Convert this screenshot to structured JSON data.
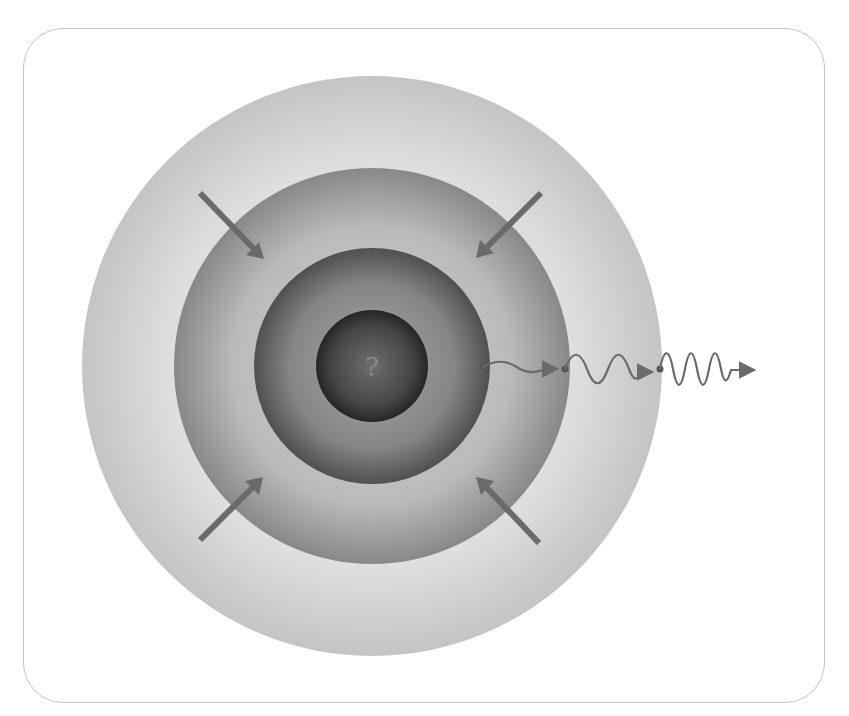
{
  "diagram": {
    "core_label": "?",
    "layers": [
      {
        "name": "outer-shell",
        "radius": 290,
        "color_edge": "#c9c9c9",
        "color_inner": "#e4e4e4"
      },
      {
        "name": "second-shell",
        "radius": 198,
        "color_edge": "#8a8a8a",
        "color_inner": "#cfcfcf"
      },
      {
        "name": "third-shell",
        "radius": 118,
        "color_edge": "#555555",
        "color_inner": "#9a9a9a"
      },
      {
        "name": "core",
        "radius": 56,
        "color_edge": "#2a2a2a",
        "color_inner": "#6a6a6a"
      }
    ],
    "inward_arrows": [
      {
        "position": "top-left"
      },
      {
        "position": "top-right"
      },
      {
        "position": "bottom-left"
      },
      {
        "position": "bottom-right"
      }
    ],
    "wave_segments": [
      {
        "name": "wave-low-frequency",
        "color": "#6b6b6b"
      },
      {
        "name": "wave-mid-frequency",
        "color": "#6b6b6b"
      },
      {
        "name": "wave-high-frequency",
        "color": "#6b6b6b"
      }
    ],
    "arrow_color": "#666666"
  }
}
